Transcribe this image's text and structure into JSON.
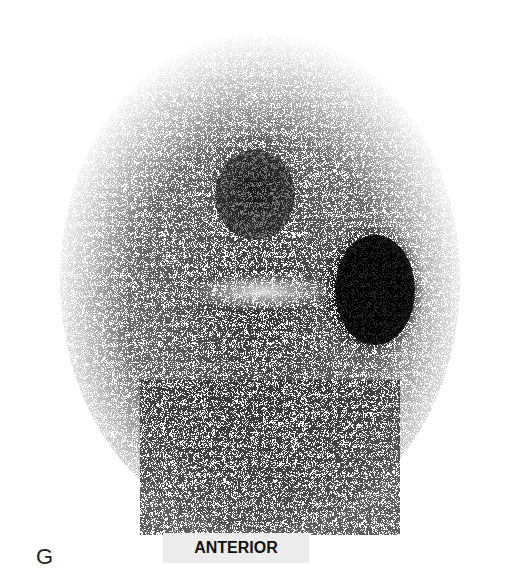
{
  "figure": {
    "panel_letter": "G",
    "view_label": "ANTERIOR",
    "image_description": "Grayscale nuclear medicine scintigraphy (anterior view) showing a head/neck region with a dark uptake focus superiorly, a brighter horizontal band in the middle, and an intense dark oval uptake on the right side."
  }
}
